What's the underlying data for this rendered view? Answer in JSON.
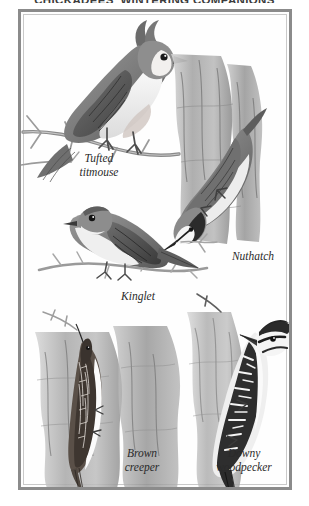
{
  "plate": {
    "title": "CHICKADEES' WINTERING COMPANIONS",
    "frame_color": "#8b8b8b",
    "background_color": "#ffffff",
    "ink_color": "#2a2a2a"
  },
  "labels": {
    "titmouse": "Tufted\ntitmouse",
    "nuthatch": "Nuthatch",
    "kinglet": "Kinglet",
    "creeper": "Brown\ncreeper",
    "woodpecker": "Downy\nwoodpecker"
  },
  "illustrations": [
    {
      "name": "tufted-titmouse",
      "pose": "perched on bare branch, crest raised, facing right"
    },
    {
      "name": "nuthatch",
      "pose": "head-down on tree trunk, facing left"
    },
    {
      "name": "kinglet",
      "pose": "perched on twig, facing left"
    },
    {
      "name": "brown-creeper",
      "pose": "clinging upright to bark, facing up"
    },
    {
      "name": "downy-woodpecker",
      "pose": "clinging upright to trunk, facing left"
    }
  ]
}
